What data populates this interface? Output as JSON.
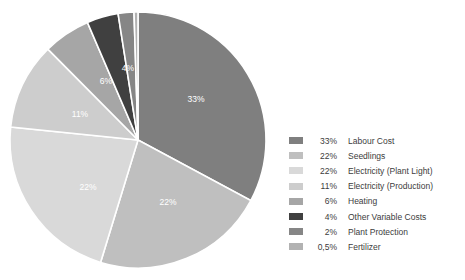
{
  "chart_data": {
    "type": "pie",
    "title": "",
    "subtitle": "",
    "xlabel": "",
    "ylabel": "",
    "legend_position": "right",
    "grid": false,
    "start_angle_deg": 0,
    "direction": "clockwise",
    "categories": [
      "Labour Cost",
      "Seedlings",
      "Electricity (Plant Light)",
      "Electricity (Production)",
      "Heating",
      "Other Variable Costs",
      "Plant Protection",
      "Fertilizer"
    ],
    "values": [
      33,
      22,
      22,
      11,
      6,
      4,
      2,
      0.5
    ],
    "value_labels": [
      "33%",
      "22%",
      "22%",
      "11%",
      "6%",
      "4%",
      "2%",
      "0,5%"
    ],
    "slice_label_shown": [
      "33%",
      "22%",
      "22%",
      "11%",
      "6%",
      "4%",
      "",
      ""
    ],
    "colors": [
      "#7f7f7f",
      "#bfbfbf",
      "#d9d9d9",
      "#cdcdcd",
      "#a6a6a6",
      "#404040",
      "#868686",
      "#b2b2b2"
    ],
    "slice_border_color": "#ffffff",
    "label_text_color": "#ffffff",
    "background": "#ffffff"
  },
  "pie": {
    "center_x": 138,
    "center_y": 140,
    "radius": 128,
    "slice_labels": [
      {
        "text": "33%",
        "x": 196,
        "y": 100
      },
      {
        "text": "22%",
        "x": 168,
        "y": 203
      },
      {
        "text": "22%",
        "x": 88,
        "y": 188
      },
      {
        "text": "11%",
        "x": 80,
        "y": 115
      },
      {
        "text": "6%",
        "x": 106,
        "y": 82
      },
      {
        "text": "4%",
        "x": 128,
        "y": 69
      }
    ]
  },
  "legend": {
    "rows": [
      {
        "pct": "33%",
        "name": "Labour Cost",
        "color": "#7f7f7f"
      },
      {
        "pct": "22%",
        "name": "Seedlings",
        "color": "#bfbfbf"
      },
      {
        "pct": "22%",
        "name": "Electricity (Plant Light)",
        "color": "#d9d9d9"
      },
      {
        "pct": "11%",
        "name": "Electricity (Production)",
        "color": "#cdcdcd"
      },
      {
        "pct": "6%",
        "name": "Heating",
        "color": "#a6a6a6"
      },
      {
        "pct": "4%",
        "name": "Other Variable Costs",
        "color": "#404040"
      },
      {
        "pct": "2%",
        "name": "Plant Protection",
        "color": "#868686"
      },
      {
        "pct": "0,5%",
        "name": "Fertilizer",
        "color": "#b2b2b2"
      }
    ]
  }
}
